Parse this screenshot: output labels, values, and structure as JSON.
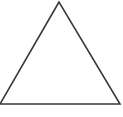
{
  "figure": {
    "name": "triangle",
    "canvas": {
      "width": 123,
      "height": 117,
      "background_color": "#ffffff"
    },
    "shape": {
      "type": "triangle",
      "stroke_color": "#3a3a3a",
      "stroke_width": 1.6,
      "fill": "none",
      "vertices": [
        {
          "name": "apex",
          "x": 59,
          "y": 2
        },
        {
          "name": "bottom-left",
          "x": 0,
          "y": 104
        },
        {
          "name": "bottom-right",
          "x": 120,
          "y": 104
        }
      ],
      "points_attr": "59,2 0,104 120,104",
      "edges": [
        {
          "name": "left-edge",
          "from": "apex",
          "to": "bottom-left"
        },
        {
          "name": "base-edge",
          "from": "bottom-left",
          "to": "bottom-right"
        },
        {
          "name": "right-edge",
          "from": "bottom-right",
          "to": "apex"
        }
      ]
    }
  }
}
